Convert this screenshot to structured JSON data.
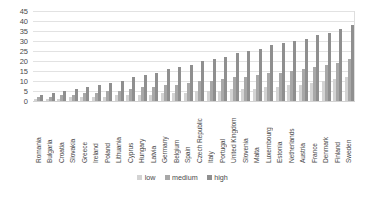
{
  "chart_data": {
    "type": "bar",
    "title": "",
    "subtitle": "",
    "xlabel": "",
    "ylabel": "",
    "ylim": [
      0,
      45
    ],
    "yticks": [
      0,
      5,
      10,
      15,
      20,
      25,
      30,
      35,
      40,
      45
    ],
    "grid": true,
    "legend_position": "bottom",
    "categories": [
      "Romania",
      "Bulgaria",
      "Croatia",
      "Slovakia",
      "Greece",
      "Ireland",
      "Poland",
      "Lithuania",
      "Cyprus",
      "Hungary",
      "Latvia",
      "Germany",
      "Belgium",
      "Spain",
      "Czech Republic",
      "Italy",
      "Portugal",
      "United Kingdom",
      "Slovenia",
      "Malta",
      "Luxembourg",
      "Estonia",
      "Netherlands",
      "Austria",
      "France",
      "Denmark",
      "Finland",
      "Sweden"
    ],
    "series": [
      {
        "name": "low",
        "color": "#d3d3d3",
        "values": [
          1,
          1,
          1,
          2,
          2,
          2,
          2,
          3,
          3,
          3,
          3,
          4,
          4,
          4,
          5,
          5,
          5,
          6,
          6,
          6,
          7,
          7,
          8,
          8,
          9,
          10,
          11,
          12
        ]
      },
      {
        "name": "medium",
        "color": "#a8a8a8",
        "values": [
          2,
          2,
          3,
          3,
          4,
          4,
          5,
          5,
          6,
          7,
          7,
          8,
          8,
          9,
          10,
          10,
          11,
          12,
          12,
          13,
          14,
          14,
          15,
          16,
          17,
          18,
          19,
          21
        ]
      },
      {
        "name": "high",
        "color": "#8f8f8f",
        "values": [
          3,
          4,
          5,
          6,
          7,
          8,
          9,
          10,
          12,
          13,
          14,
          16,
          17,
          18,
          20,
          21,
          22,
          24,
          25,
          26,
          28,
          29,
          30,
          31,
          33,
          34,
          36,
          38
        ]
      }
    ]
  },
  "legend": {
    "items": [
      {
        "label": "low"
      },
      {
        "label": "medium"
      },
      {
        "label": "high"
      }
    ]
  }
}
